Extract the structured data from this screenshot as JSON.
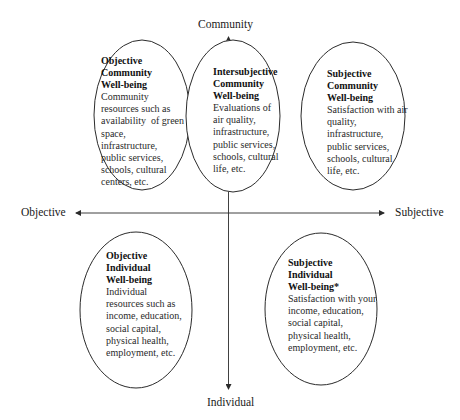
{
  "axes": {
    "top_label": "Community",
    "bottom_label": "Individual",
    "left_label": "Objective",
    "right_label": "Subjective"
  },
  "bubbles": [
    {
      "id": "objective-community",
      "title_lines": [
        "Objective",
        "Community",
        "Well-being"
      ],
      "desc_lines": [
        "Community",
        "resources such as",
        "availability  of green",
        "space,",
        "infrastructure,",
        "public services,",
        "schools, cultural",
        "centers, etc."
      ]
    },
    {
      "id": "intersubjective-community",
      "title_lines": [
        "Intersubjective",
        "Community",
        "Well-being"
      ],
      "desc_lines": [
        "Evaluations of",
        "air quality,",
        "infrastructure,",
        "public services,",
        "schools, cultural",
        "life, etc."
      ]
    },
    {
      "id": "subjective-community",
      "title_lines": [
        "Subjective",
        "Community",
        "Well-being"
      ],
      "desc_lines": [
        "Satisfaction with air",
        "quality,",
        "infrastructure,",
        "public services,",
        "schools, cultural",
        "life, etc."
      ]
    },
    {
      "id": "objective-individual",
      "title_lines": [
        "Objective",
        "Individual",
        "Well-being"
      ],
      "desc_lines": [
        "Individual",
        "resources such as",
        "income, education,",
        "social capital,",
        "physical health,",
        "employment, etc."
      ]
    },
    {
      "id": "subjective-individual",
      "title_lines": [
        "Subjective",
        "Individual",
        "Well-being*"
      ],
      "desc_lines": [
        "Satisfaction with your",
        "income, education,",
        "social capital,",
        "physical health,",
        "employment, etc."
      ]
    }
  ],
  "colors": {
    "stroke": "#2b2b2b",
    "text": "#1a1a1a",
    "background": "#ffffff"
  }
}
